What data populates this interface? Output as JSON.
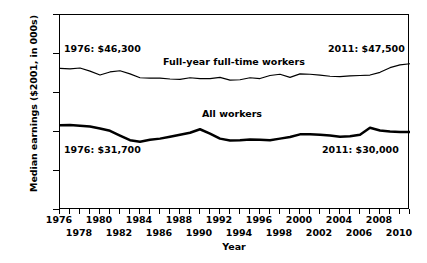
{
  "chart_data": {
    "type": "line",
    "title": "",
    "xlabel": "Year",
    "ylabel": "Median earnings ($2001, in 000s)",
    "xlim": [
      1976,
      2011
    ],
    "ylim": [
      10,
      60
    ],
    "yticks": [
      "$10",
      "$20",
      "$30",
      "$40",
      "$50",
      "$60"
    ],
    "ytick_values": [
      10,
      20,
      30,
      40,
      50,
      60
    ],
    "xticks_row0": [
      1976,
      1980,
      1984,
      1988,
      1992,
      1996,
      2000,
      2004,
      2008
    ],
    "xticks_row1": [
      1978,
      1982,
      1986,
      1990,
      1994,
      1998,
      2002,
      2006,
      2010
    ],
    "grid": false,
    "legend_position": "inline-labels",
    "x": [
      1976,
      1977,
      1978,
      1979,
      1980,
      1981,
      1982,
      1983,
      1984,
      1985,
      1986,
      1987,
      1988,
      1989,
      1990,
      1991,
      1992,
      1993,
      1994,
      1995,
      1996,
      1997,
      1998,
      1999,
      2000,
      2001,
      2002,
      2003,
      2004,
      2005,
      2006,
      2007,
      2008,
      2009,
      2010,
      2011
    ],
    "series": [
      {
        "name": "Full-year full-time workers",
        "line_width": "thin",
        "color": "#000000",
        "values": [
          46.3,
          46.2,
          46.4,
          45.6,
          44.6,
          45.4,
          45.7,
          44.9,
          43.9,
          43.8,
          43.8,
          43.6,
          43.5,
          43.9,
          43.7,
          43.7,
          44.0,
          43.3,
          43.4,
          43.9,
          43.7,
          44.5,
          44.8,
          44.0,
          44.9,
          44.8,
          44.6,
          44.3,
          44.2,
          44.4,
          44.5,
          44.6,
          45.3,
          46.5,
          47.2,
          47.5
        ],
        "start_label": "1976: $46,300",
        "end_label": "2011: $47,500"
      },
      {
        "name": "All workers",
        "line_width": "thick",
        "color": "#000000",
        "values": [
          31.7,
          31.8,
          31.6,
          31.4,
          30.9,
          30.3,
          29.1,
          27.9,
          27.5,
          28.0,
          28.3,
          28.8,
          29.3,
          29.8,
          30.7,
          29.6,
          28.3,
          27.8,
          27.9,
          28.1,
          28.0,
          27.9,
          28.3,
          28.7,
          29.4,
          29.4,
          29.3,
          29.1,
          28.8,
          28.9,
          29.3,
          31.1,
          30.4,
          30.1,
          30.0,
          30.0
        ],
        "start_label": "1976: $31,700",
        "end_label": "2011: $30,000"
      }
    ],
    "annotations": [
      {
        "id": "ann-top-left",
        "text": "1976: $46,300"
      },
      {
        "id": "ann-top-right",
        "text": "2011: $47,500"
      },
      {
        "id": "ann-bottom-left",
        "text": "1976: $31,700"
      },
      {
        "id": "ann-bottom-right",
        "text": "2011: $30,000"
      },
      {
        "id": "label-fyft",
        "text": "Full-year full-time workers"
      },
      {
        "id": "label-all",
        "text": "All workers"
      }
    ]
  }
}
